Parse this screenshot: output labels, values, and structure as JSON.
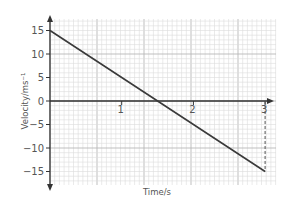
{
  "chart_data": {
    "type": "line",
    "title": "",
    "xlabel": "Time/s",
    "ylabel": "Velocity/ms⁻¹",
    "xlim": [
      0,
      3.15
    ],
    "ylim": [
      -18,
      18
    ],
    "x_ticks": [
      "1",
      "2",
      "3"
    ],
    "y_ticks": [
      "15",
      "10",
      "5",
      "0",
      "−5",
      "−10",
      "−15"
    ],
    "grid": true,
    "legend": null,
    "series": [
      {
        "name": "velocity",
        "x": [
          0,
          1.5,
          3
        ],
        "values": [
          15,
          0,
          -15
        ]
      }
    ],
    "annotations": [
      {
        "type": "dashed-vertical-line",
        "x": 3,
        "from": -15,
        "to": 0
      }
    ]
  },
  "colors": {
    "line": "#3a3a3a",
    "axis": "#333333",
    "grid_minor": "#dcdcdc",
    "grid_major": "#b8b8b8",
    "text": "#555555"
  }
}
